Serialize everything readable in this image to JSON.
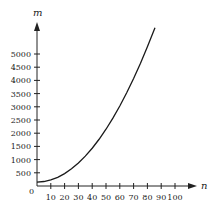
{
  "chart_data": {
    "type": "line",
    "title": "",
    "xlabel": "n",
    "ylabel": "m",
    "origin_label": "0",
    "xlim": [
      0,
      114
    ],
    "ylim": [
      0,
      5800
    ],
    "x_ticks": [
      10,
      20,
      30,
      40,
      50,
      60,
      70,
      80,
      90,
      100
    ],
    "y_ticks": [
      500,
      1000,
      1500,
      2000,
      2500,
      3000,
      3500,
      4000,
      4500,
      5000
    ],
    "grid": false,
    "legend": null,
    "series": [
      {
        "name": "m vs n",
        "x": [
          0,
          5,
          10,
          15,
          20,
          25,
          30,
          35,
          40,
          45,
          50,
          55,
          60,
          65,
          70,
          75,
          80,
          85.5
        ],
        "values": [
          150,
          170,
          230,
          330,
          470,
          650,
          870,
          1130,
          1430,
          1770,
          2150,
          2570,
          3030,
          3530,
          4070,
          4650,
          5270,
          5990
        ]
      }
    ],
    "colors": {
      "axis": "#222222",
      "line": "#1a1a1a",
      "background": "#ffffff"
    }
  }
}
